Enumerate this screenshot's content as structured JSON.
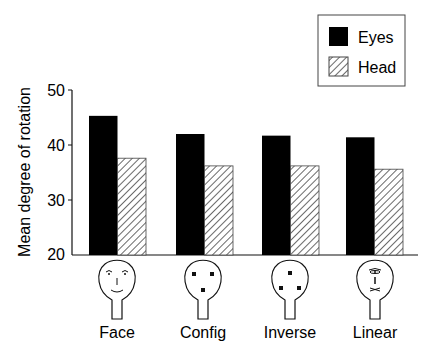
{
  "chart_data": {
    "type": "bar",
    "title": "",
    "xlabel": "",
    "ylabel": "Mean degree of rotation",
    "ylim": [
      20,
      50
    ],
    "yticks": [
      20,
      30,
      40,
      50
    ],
    "categories": [
      "Face",
      "Config",
      "Inverse",
      "Linear"
    ],
    "series": [
      {
        "name": "Eyes",
        "fill": "solid",
        "color": "#000000",
        "values": [
          45.3,
          42.0,
          41.7,
          41.4
        ]
      },
      {
        "name": "Head",
        "fill": "hatched",
        "color": "#555555",
        "values": [
          37.6,
          36.2,
          36.2,
          35.6
        ]
      }
    ],
    "grid": false,
    "legend_position": "top-right",
    "category_icons": [
      "face-schematic-icon",
      "config-three-squares-icon",
      "inverse-three-squares-icon",
      "linear-vertical-features-icon"
    ]
  },
  "legend": {
    "items": [
      {
        "label": "Eyes"
      },
      {
        "label": "Head"
      }
    ]
  },
  "axis": {
    "ylabel": "Mean degree of rotation",
    "ticks": [
      "50",
      "40",
      "30",
      "20"
    ]
  },
  "categories": [
    {
      "label": "Face"
    },
    {
      "label": "Config"
    },
    {
      "label": "Inverse"
    },
    {
      "label": "Linear"
    }
  ]
}
